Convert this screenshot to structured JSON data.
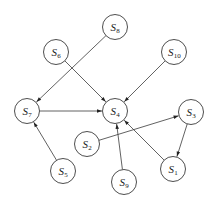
{
  "diagram": {
    "type": "directed-graph",
    "node_radius": 12.5,
    "stroke_color": "#3a3a3a",
    "nodes": [
      {
        "id": "S1",
        "label": "S",
        "sub": "1",
        "x": 173,
        "y": 169
      },
      {
        "id": "S2",
        "label": "S",
        "sub": "2",
        "x": 87,
        "y": 144
      },
      {
        "id": "S3",
        "label": "S",
        "sub": "3",
        "x": 191,
        "y": 112
      },
      {
        "id": "S4",
        "label": "S",
        "sub": "4",
        "x": 115,
        "y": 111
      },
      {
        "id": "S5",
        "label": "S",
        "sub": "5",
        "x": 63,
        "y": 171
      },
      {
        "id": "S6",
        "label": "S",
        "sub": "6",
        "x": 56,
        "y": 52
      },
      {
        "id": "S7",
        "label": "S",
        "sub": "7",
        "x": 27,
        "y": 111
      },
      {
        "id": "S8",
        "label": "S",
        "sub": "8",
        "x": 115,
        "y": 27
      },
      {
        "id": "S9",
        "label": "S",
        "sub": "9",
        "x": 124,
        "y": 182
      },
      {
        "id": "S10",
        "label": "S",
        "sub": "10",
        "x": 174,
        "y": 52
      }
    ],
    "edges": [
      {
        "from": "S8",
        "to": "S7"
      },
      {
        "from": "S6",
        "to": "S4"
      },
      {
        "from": "S10",
        "to": "S4"
      },
      {
        "from": "S7",
        "to": "S4"
      },
      {
        "from": "S5",
        "to": "S7"
      },
      {
        "from": "S2",
        "to": "S3"
      },
      {
        "from": "S3",
        "to": "S1"
      },
      {
        "from": "S1",
        "to": "S4"
      },
      {
        "from": "S9",
        "to": "S4"
      }
    ]
  }
}
